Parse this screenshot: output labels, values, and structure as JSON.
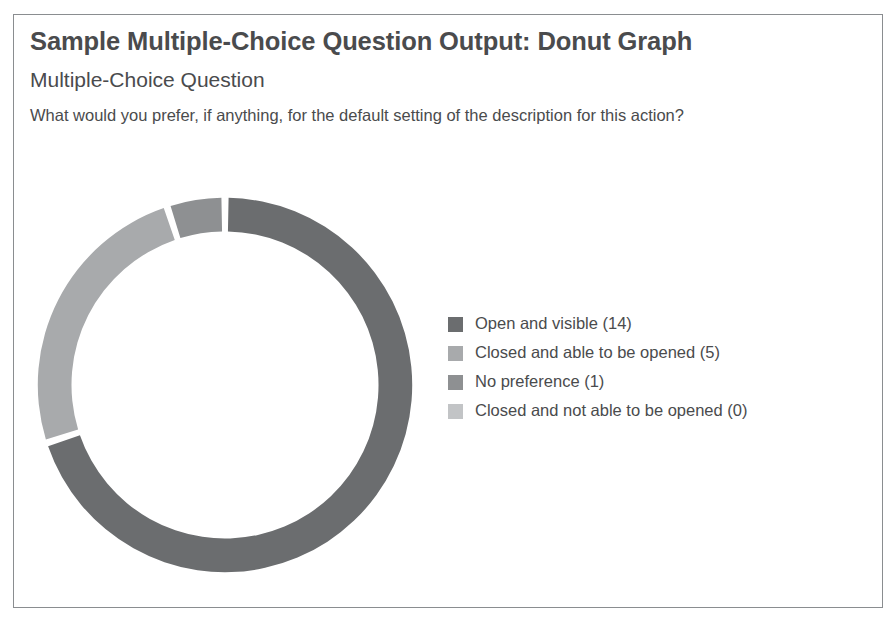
{
  "card": {
    "title": "Sample Multiple-Choice Question Output: Donut Graph",
    "kicker": "Multiple-Choice Question",
    "question": "What would you prefer, if anything, for the default setting of the description for this action?"
  },
  "chart_data": {
    "type": "pie",
    "variant": "donut",
    "title": "Sample Multiple-Choice Question Output: Donut Graph",
    "subtitle": "Multiple-Choice Question",
    "question": "What would you prefer, if anything, for the default setting of the description for this action?",
    "categories": [
      "Open and visible",
      "Closed and able to be opened",
      "No preference",
      "Closed and not able to be opened"
    ],
    "values": [
      14,
      5,
      1,
      0
    ],
    "total": 20,
    "colors": [
      "#6b6d6f",
      "#a8aaac",
      "#8e9092",
      "#c2c4c6"
    ],
    "legend_labels": [
      "Open and visible (14)",
      "Closed and able to be opened (5)",
      "No preference (1)",
      "Closed and not able to be opened (0)"
    ],
    "legend_position": "right",
    "start_angle_deg": 0,
    "direction": "clockwise",
    "inner_radius_ratio": 0.82,
    "gap_deg": 2.2,
    "grid": false,
    "xlabel": "",
    "ylabel": ""
  },
  "legend": {
    "items": [
      {
        "label": "Open and visible (14)",
        "color": "#6b6d6f",
        "value": 14,
        "category": "Open and visible"
      },
      {
        "label": "Closed and able to be opened (5)",
        "color": "#a8aaac",
        "value": 5,
        "category": "Closed and able to be opened"
      },
      {
        "label": "No preference (1)",
        "color": "#8e9092",
        "value": 1,
        "category": "No preference"
      },
      {
        "label": "Closed and not able to be opened (0)",
        "color": "#c2c4c6",
        "value": 0,
        "category": "Closed and not able to be opened"
      }
    ]
  }
}
